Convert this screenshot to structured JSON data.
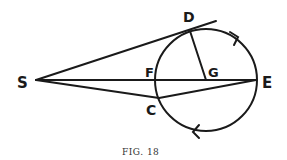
{
  "figure": {
    "caption": "FIG. 18",
    "labels": {
      "S": "S",
      "D": "D",
      "F": "F",
      "G": "G",
      "E": "E",
      "C": "C"
    },
    "points": {
      "S": [
        36,
        80
      ],
      "D": [
        190,
        30
      ],
      "F": [
        157,
        80
      ],
      "G": [
        206,
        80
      ],
      "E": [
        256,
        80
      ],
      "C": [
        159,
        98
      ]
    },
    "circle": {
      "cx": 206,
      "cy": 80,
      "r": 51
    },
    "arrows": [
      "clockwise-top-right",
      "clockwise-bottom-left"
    ],
    "colors": {
      "stroke": "#1a1a1a",
      "background": "#ffffff"
    }
  }
}
